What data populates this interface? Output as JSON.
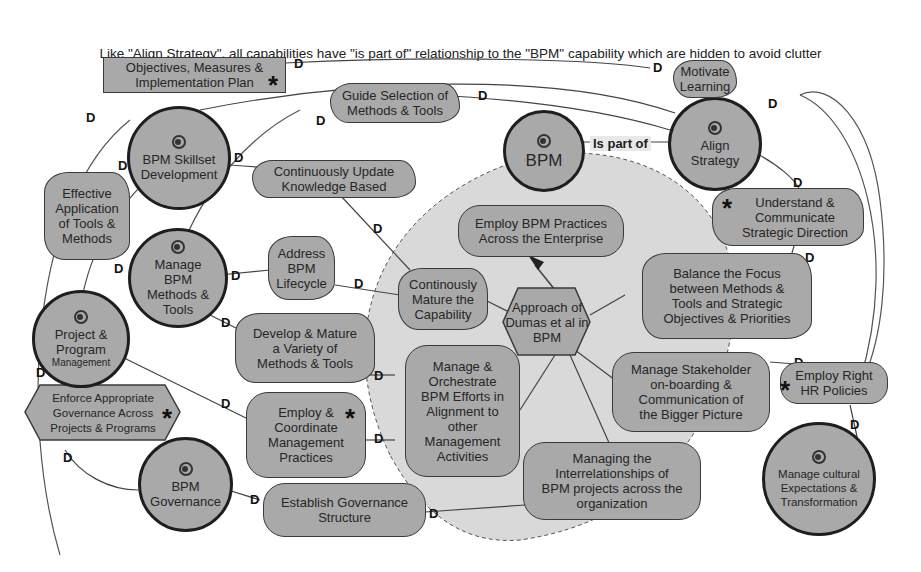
{
  "caption": "Like \"Align Strategy\", all capabilities have \"is part of\" relationship to the \"BPM\" capability which are hidden to avoid clutter",
  "colors": {
    "node_fill": "#a9a9a9",
    "node_border": "#3a3a3a",
    "capability_border": "#1e1e1e",
    "inner_region_fill": "#d9d9d9",
    "line": "#444444",
    "background": "#ffffff"
  },
  "relationship_label": "Is part of",
  "capabilities": {
    "bpm": "BPM",
    "align_strategy": "Align\nStrategy",
    "skillset": "BPM Skillset\nDevelopment",
    "manage_methods": "Manage\nBPM\nMethods &\nTools",
    "project_program": "Project &\nProgram",
    "project_program_small": "Management",
    "governance": "BPM\nGovernance",
    "cultural": "Manage cultural\nExpectations &\nTransformation"
  },
  "nodes": {
    "objectives": "Objectives, Measures &\nImplementation Plan",
    "motivate": "Motivate\nLearning",
    "guide": "Guide Selection of\nMethods & Tools",
    "understand": "Understand &\nCommunicate\nStrategic Direction",
    "effective": "Effective\nApplication\nof Tools &\nMethods",
    "continuously_update": "Continuously Update\nKnowledge Based",
    "employ_practices": "Employ BPM Practices\nAcross the Enterprise",
    "address": "Address\nBPM\nLifecycle",
    "continously_mature": "Continously\nMature the\nCapability",
    "approach": "Approach of\nDumas et al in\nBPM",
    "balance": "Balance the Focus\nbetween Methods &\nTools and Strategic\nObjectives & Priorities",
    "develop": "Develop & Mature\na Variety of\nMethods & Tools",
    "manage_orchestrate": "Manage &\nOrchestrate\nBPM Efforts in\nAlignment to\nother\nManagement\nActivities",
    "stakeholder": "Manage Stakeholder\non-boarding &\nCommunication of\nthe Bigger Picture",
    "employ_hr": "Employ Right\nHR Policies",
    "enforce": "Enforce Appropriate\nGovernance Across\nProjects & Programs",
    "employ_coordinate": "Employ &\nCoordinate\nManagement\nPractices",
    "interrelationships": "Managing the\nInterrelationships of\nBPM projects across the\norganization",
    "establish": "Establish Governance\nStructure"
  },
  "markers": {
    "star": "*"
  },
  "icons": {
    "capability": "swirl-icon",
    "dependency": "d-connector-icon",
    "arrow": "arrowhead-icon"
  }
}
